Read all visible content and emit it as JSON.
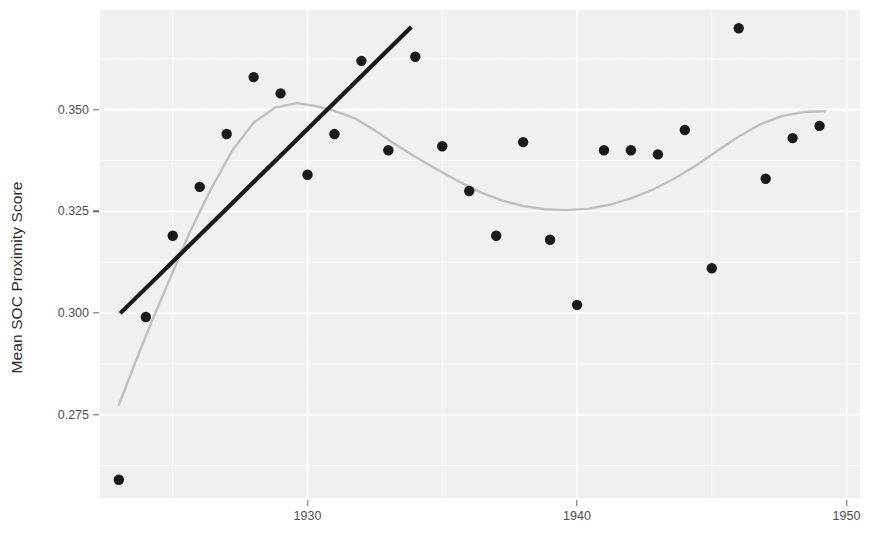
{
  "axes": {
    "ylabel": "Mean SOC Proximity Score",
    "xlabel": "",
    "y_ticks": [
      "0.275",
      "0.300",
      "0.325",
      "0.350"
    ],
    "x_ticks": [
      "1930",
      "1940",
      "1950"
    ]
  },
  "colors": {
    "panel_background": "#f2f2f2",
    "gridline": "#ffffff",
    "point": "#1a1a1a",
    "trend_line": "#1a1a1a",
    "smooth_line": "#bfbfbf",
    "tick_text": "#4d4d4d",
    "axis_title": "#2b2b2b"
  },
  "chart_data": {
    "type": "scatter",
    "title": "",
    "xlabel": "",
    "ylabel": "Mean SOC Proximity Score",
    "xlim": [
      1922.3,
      1950.5
    ],
    "ylim": [
      0.2545,
      0.3745
    ],
    "xticks": [
      1930,
      1940,
      1950
    ],
    "yticks": [
      0.275,
      0.3,
      0.325,
      0.35
    ],
    "grid": true,
    "legend": "none",
    "x": [
      1923,
      1924,
      1925,
      1926,
      1927,
      1928,
      1929,
      1930,
      1931,
      1932,
      1933,
      1934,
      1935,
      1936,
      1937,
      1938,
      1939,
      1940,
      1941,
      1942,
      1943,
      1944,
      1945,
      1946,
      1947,
      1948,
      1949
    ],
    "y": [
      0.259,
      0.299,
      0.319,
      0.331,
      0.344,
      0.358,
      0.354,
      0.334,
      0.344,
      0.362,
      0.34,
      0.363,
      0.341,
      0.33,
      0.319,
      0.342,
      0.318,
      0.302,
      0.34,
      0.34,
      0.339,
      0.345,
      0.311,
      0.37,
      0.333,
      0.343,
      0.346
    ],
    "series": [
      {
        "name": "Mean SOC Proximity Score",
        "kind": "points",
        "x": [
          1923,
          1924,
          1925,
          1926,
          1927,
          1928,
          1929,
          1930,
          1931,
          1932,
          1933,
          1934,
          1935,
          1936,
          1937,
          1938,
          1939,
          1940,
          1941,
          1942,
          1943,
          1944,
          1945,
          1946,
          1947,
          1948,
          1949
        ],
        "y": [
          0.259,
          0.299,
          0.319,
          0.331,
          0.344,
          0.358,
          0.354,
          0.334,
          0.344,
          0.362,
          0.34,
          0.363,
          0.341,
          0.33,
          0.319,
          0.342,
          0.318,
          0.302,
          0.34,
          0.34,
          0.339,
          0.345,
          0.311,
          0.37,
          0.333,
          0.343,
          0.346
        ]
      },
      {
        "name": "linear trend",
        "kind": "line",
        "x": [
          1923.05,
          1933.85
        ],
        "y": [
          0.2999,
          0.3703
        ]
      },
      {
        "name": "loess smooth",
        "kind": "smooth",
        "x": [
          1923.0,
          1923.6,
          1924.2,
          1924.9,
          1925.6,
          1926.4,
          1927.2,
          1928.0,
          1928.8,
          1929.6,
          1930.3,
          1931.0,
          1931.8,
          1932.5,
          1933.2,
          1934.0,
          1934.8,
          1935.6,
          1936.4,
          1937.2,
          1938.0,
          1938.8,
          1939.6,
          1940.4,
          1941.2,
          1942.0,
          1942.8,
          1943.6,
          1944.4,
          1945.2,
          1946.0,
          1946.8,
          1947.6,
          1948.4,
          1949.2
        ],
        "y": [
          0.2774,
          0.2877,
          0.2976,
          0.3085,
          0.3194,
          0.3302,
          0.3399,
          0.3468,
          0.3505,
          0.3516,
          0.3509,
          0.3497,
          0.3477,
          0.3449,
          0.3417,
          0.3384,
          0.3353,
          0.3324,
          0.3297,
          0.3277,
          0.3263,
          0.3255,
          0.3253,
          0.3256,
          0.3266,
          0.3282,
          0.3303,
          0.333,
          0.3362,
          0.3398,
          0.3434,
          0.3464,
          0.3484,
          0.3494,
          0.3496
        ]
      }
    ]
  }
}
